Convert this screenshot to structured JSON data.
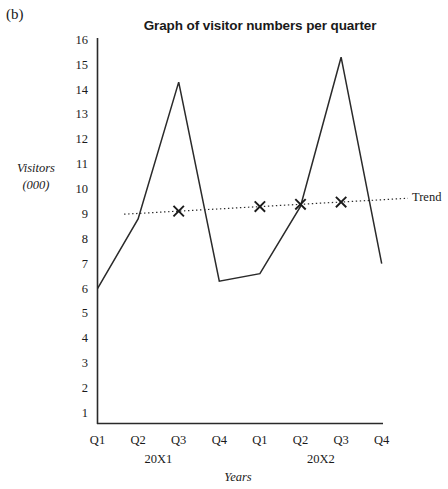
{
  "figure": {
    "part_label": "(b)",
    "trend_label": "Trend"
  },
  "chart_data": {
    "type": "line",
    "title": "Graph of visitor numbers per quarter",
    "xlabel": "Years",
    "ylabel": "Visitors (000)",
    "ylabel_line1": "Visitors",
    "ylabel_line2": "(000)",
    "ylim": [
      0,
      16
    ],
    "yticks": [
      16,
      15,
      14,
      13,
      12,
      11,
      10,
      9,
      8,
      7,
      6,
      5,
      4,
      3,
      2,
      1
    ],
    "grid": false,
    "legend": "none",
    "categories": [
      "Q1",
      "Q2",
      "Q3",
      "Q4",
      "Q1",
      "Q2",
      "Q3",
      "Q4"
    ],
    "groups": [
      {
        "label": "20X1",
        "quarters": [
          "Q1",
          "Q2",
          "Q3",
          "Q4"
        ]
      },
      {
        "label": "20X2",
        "quarters": [
          "Q1",
          "Q2",
          "Q3",
          "Q4"
        ]
      }
    ],
    "series": [
      {
        "name": "Visitors",
        "style": "solid",
        "values": [
          6.0,
          8.8,
          14.3,
          6.3,
          6.6,
          9.3,
          15.3,
          7.0
        ]
      },
      {
        "name": "Trend",
        "style": "dotted",
        "marker": "x",
        "marker_categories": [
          "Q3",
          "Q1",
          "Q2",
          "Q3"
        ],
        "marker_values": [
          9.15,
          9.25,
          9.35,
          9.45
        ],
        "values": [
          null,
          9.05,
          9.15,
          9.25,
          9.3,
          9.4,
          9.5,
          9.6
        ]
      }
    ]
  }
}
